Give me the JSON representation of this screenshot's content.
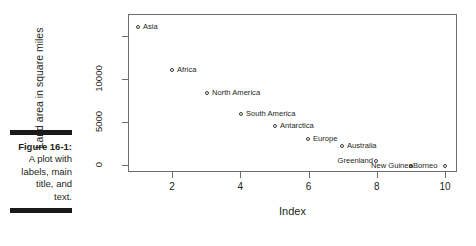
{
  "figure": {
    "caption_title": "Figure 16-1:",
    "caption_lines": [
      "A plot with",
      "labels, main",
      "title, and",
      "text."
    ]
  },
  "chart_data": {
    "type": "scatter",
    "title": "",
    "xlabel": "Index",
    "ylabel": "Land area in square miles",
    "xlim": [
      0.64,
      10.36
    ],
    "ylim": [
      -620,
      17560
    ],
    "grid": false,
    "legend": "none",
    "x_ticks": [
      2,
      4,
      6,
      8,
      10
    ],
    "x_tick_labels": [
      "2",
      "4",
      "6",
      "8",
      "10"
    ],
    "y_ticks": [
      0,
      5000,
      10000,
      15000
    ],
    "y_tick_labels": [
      "0",
      "5000",
      "10000",
      ""
    ],
    "point_style": "open-circle",
    "label_position": "right-of-point",
    "x": [
      1,
      2,
      3,
      4,
      5,
      6,
      7,
      8,
      9,
      10
    ],
    "values": [
      16900,
      11500,
      9400,
      6900,
      5100,
      3800,
      2900,
      840,
      306,
      280
    ],
    "point_labels": [
      "Asia",
      "Africa",
      "North America",
      "South America",
      "Antarctica",
      "Europe",
      "Australia",
      "Greenland",
      "New Guinea",
      "Borneo"
    ],
    "points": [
      {
        "label": "Asia",
        "x": 1,
        "y": 16900,
        "px": 138,
        "py": 27,
        "lx": 143,
        "ly": 27,
        "anchor": "left"
      },
      {
        "label": "Africa",
        "x": 2,
        "y": 11500,
        "px": 172,
        "py": 70,
        "lx": 177,
        "ly": 70,
        "anchor": "left"
      },
      {
        "label": "North America",
        "x": 3,
        "y": 9400,
        "px": 207,
        "py": 93,
        "lx": 212,
        "ly": 93,
        "anchor": "left"
      },
      {
        "label": "South America",
        "x": 4,
        "y": 6900,
        "px": 241,
        "py": 114,
        "lx": 246,
        "ly": 114,
        "anchor": "left"
      },
      {
        "label": "Antarctica",
        "x": 5,
        "y": 5100,
        "px": 275,
        "py": 126,
        "lx": 280,
        "ly": 126,
        "anchor": "left"
      },
      {
        "label": "Europe",
        "x": 6,
        "y": 3800,
        "px": 308,
        "py": 139,
        "lx": 313,
        "ly": 139,
        "anchor": "left"
      },
      {
        "label": "Australia",
        "x": 7,
        "y": 2900,
        "px": 342,
        "py": 146,
        "lx": 347,
        "ly": 146,
        "anchor": "left"
      },
      {
        "label": "Greenland",
        "x": 8,
        "y": 840,
        "px": 376,
        "py": 161,
        "lx": 373,
        "ly": 161,
        "anchor": "right"
      },
      {
        "label": "New Guinea",
        "x": 9,
        "y": 306,
        "px": 411,
        "py": 166,
        "lx": 371,
        "ly": 166,
        "anchor": "left"
      },
      {
        "label": "Borneo",
        "x": 10,
        "y": 280,
        "px": 445,
        "py": 166,
        "lx": 413,
        "ly": 166,
        "anchor": "left"
      }
    ]
  }
}
